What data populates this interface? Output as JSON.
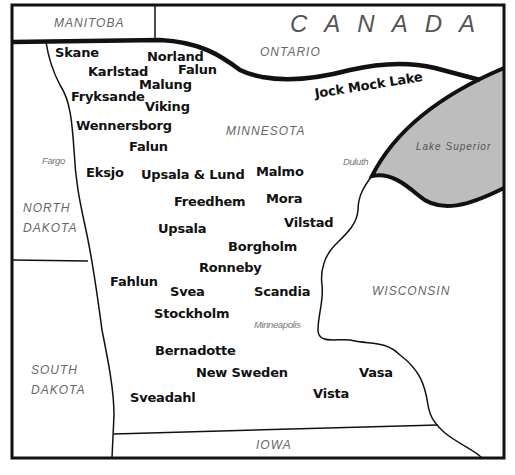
{
  "map": {
    "colors": {
      "border": "#111111",
      "lake_fill": "#bdbdbd",
      "region_text": "#666666",
      "town_text": "#111111"
    },
    "country": {
      "label": "CANADA"
    },
    "regions": {
      "manitoba": "MANITOBA",
      "ontario": "ONTARIO",
      "minnesota": "MINNESOTA",
      "north_dakota_1": "NORTH",
      "north_dakota_2": "DAKOTA",
      "south_dakota_1": "SOUTH",
      "south_dakota_2": "DAKOTA",
      "wisconsin": "WISCONSIN",
      "iowa": "IOWA"
    },
    "water": {
      "lake_superior": "Lake Superior"
    },
    "cities": {
      "fargo": "Fargo",
      "duluth": "Duluth",
      "minneapolis": "Minneapolis"
    },
    "towns": [
      {
        "name": "Skane"
      },
      {
        "name": "Norland"
      },
      {
        "name": "Karlstad"
      },
      {
        "name": "Falun"
      },
      {
        "name": "Malung"
      },
      {
        "name": "Fryksande"
      },
      {
        "name": "Viking"
      },
      {
        "name": "Wennersborg"
      },
      {
        "name": "Falun"
      },
      {
        "name": "Eksjo"
      },
      {
        "name": "Upsala & Lund"
      },
      {
        "name": "Malmo"
      },
      {
        "name": "Freedhem"
      },
      {
        "name": "Mora"
      },
      {
        "name": "Vilstad"
      },
      {
        "name": "Upsala"
      },
      {
        "name": "Borgholm"
      },
      {
        "name": "Ronneby"
      },
      {
        "name": "Fahlun"
      },
      {
        "name": "Svea"
      },
      {
        "name": "Scandia"
      },
      {
        "name": "Stockholm"
      },
      {
        "name": "Bernadotte"
      },
      {
        "name": "New Sweden"
      },
      {
        "name": "Vasa"
      },
      {
        "name": "Vista"
      },
      {
        "name": "Sveadahl"
      }
    ],
    "lakes": [
      {
        "name": "Jock Mock Lake"
      }
    ]
  }
}
